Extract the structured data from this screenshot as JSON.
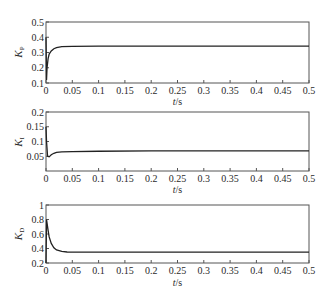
{
  "chart_data": [
    {
      "type": "line",
      "title": "",
      "ylabel": "K_P",
      "ylabel_main": "K",
      "ylabel_sub": "P",
      "xlabel": "t/s",
      "xlim": [
        0,
        0.5
      ],
      "ylim": [
        0.1,
        0.5
      ],
      "xticks": [
        "0",
        "0.05",
        "0.1",
        "0.15",
        "0.2",
        "0.25",
        "0.3",
        "0.35",
        "0.4",
        "0.45",
        "0.5"
      ],
      "yticks": [
        "0.1",
        "0.2",
        "0.3",
        "0.4",
        "0.5"
      ],
      "grid": false,
      "series": [
        {
          "name": "K_P",
          "x": [
            0,
            0.001,
            0.002,
            0.004,
            0.006,
            0.01,
            0.015,
            0.02,
            0.03,
            0.05,
            0.1,
            0.2,
            0.3,
            0.4,
            0.5
          ],
          "y": [
            0.4,
            0.12,
            0.2,
            0.26,
            0.29,
            0.31,
            0.325,
            0.332,
            0.338,
            0.34,
            0.342,
            0.342,
            0.342,
            0.342,
            0.342
          ]
        }
      ]
    },
    {
      "type": "line",
      "title": "",
      "ylabel": "K_I",
      "ylabel_main": "K",
      "ylabel_sub": "I",
      "xlabel": "t/s",
      "xlim": [
        0,
        0.5
      ],
      "ylim": [
        0,
        0.2
      ],
      "xticks": [
        "0",
        "0.05",
        "0.1",
        "0.15",
        "0.2",
        "0.25",
        "0.3",
        "0.35",
        "0.4",
        "0.45",
        "0.5"
      ],
      "yticks": [
        "0.05",
        "0.1",
        "0.15",
        "0.2"
      ],
      "grid": false,
      "series": [
        {
          "name": "K_I",
          "x": [
            0,
            0.001,
            0.003,
            0.006,
            0.01,
            0.015,
            0.02,
            0.03,
            0.05,
            0.1,
            0.2,
            0.3,
            0.4,
            0.5
          ],
          "y": [
            0.15,
            0.1,
            0.05,
            0.048,
            0.055,
            0.06,
            0.063,
            0.065,
            0.066,
            0.067,
            0.068,
            0.068,
            0.068,
            0.068
          ]
        }
      ]
    },
    {
      "type": "line",
      "title": "",
      "ylabel": "K_D",
      "ylabel_main": "K",
      "ylabel_sub": "D",
      "xlabel": "t/s",
      "xlim": [
        0,
        0.5
      ],
      "ylim": [
        0.2,
        1.0
      ],
      "xticks": [
        "0",
        "0.05",
        "0.1",
        "0.15",
        "0.2",
        "0.25",
        "0.3",
        "0.35",
        "0.4",
        "0.45",
        "0.5"
      ],
      "yticks": [
        "0.2",
        "0.4",
        "0.6",
        "0.8",
        "1"
      ],
      "grid": false,
      "series": [
        {
          "name": "K_D",
          "x": [
            0,
            0.001,
            0.002,
            0.004,
            0.006,
            0.01,
            0.015,
            0.02,
            0.03,
            0.04,
            0.05,
            0.1,
            0.2,
            0.3,
            0.4,
            0.5
          ],
          "y": [
            0.2,
            0.8,
            0.75,
            0.65,
            0.56,
            0.47,
            0.41,
            0.38,
            0.36,
            0.352,
            0.35,
            0.35,
            0.35,
            0.35,
            0.35,
            0.35
          ]
        }
      ]
    }
  ]
}
